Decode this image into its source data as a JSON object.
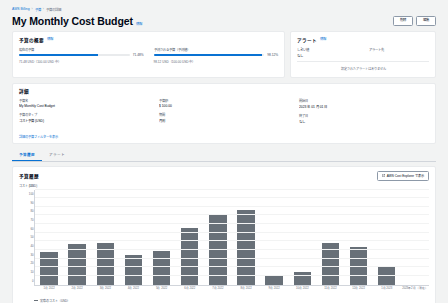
{
  "breadcrumb": {
    "items": [
      "AWS Billing",
      "予算",
      "予算の詳細"
    ]
  },
  "header": {
    "title": "My Monthly Cost Budget",
    "info_label": "情報",
    "edit_label": "編集",
    "delete_label": "削除"
  },
  "budget_panel": {
    "title": "予算の概要",
    "info_label": "情報",
    "metrics": [
      {
        "label": "現在の予算",
        "percent_text": "71.48%",
        "percent": 71.48,
        "sub": "71.48 USD（100.00 USD 中）"
      },
      {
        "label": "予測される予算（予測値）",
        "percent_text": "98.12%",
        "percent": 98.12,
        "sub": "98.12 USD（100.00 USD 中）"
      }
    ]
  },
  "alert_panel": {
    "title": "アラート",
    "info_label": "情報",
    "columns": [
      {
        "label": "しきい値",
        "value": "なし"
      },
      {
        "label": "アラート先",
        "value": ""
      }
    ],
    "empty_text": "設定されたアラートはありません"
  },
  "detail_panel": {
    "title": "詳細",
    "fields": [
      {
        "label": "予算名",
        "value": "My Monthly Cost Budget"
      },
      {
        "label": "予算のタイプ",
        "value": "コスト予算 (USD)"
      },
      {
        "label": "予算額",
        "value": "$ 100.00"
      },
      {
        "label": "期間",
        "value": "月別"
      },
      {
        "label": "開始日",
        "value": "2023 年 01 月 01 日"
      },
      {
        "label": "終了日",
        "value": "なし"
      }
    ],
    "link_label": "詳細の予算フィルターを表示"
  },
  "tabs": [
    {
      "label": "予算履歴",
      "active": true
    },
    {
      "label": "アラート",
      "active": false
    }
  ],
  "chart_panel": {
    "title": "予算履歴",
    "explorer_button": "AWS Cost Explorer で表示",
    "icon": "external-link-icon"
  },
  "chart_data": {
    "type": "bar",
    "title": "予算履歴",
    "ylabel": "コスト (USD)",
    "xlabel": "",
    "ylim": [
      0,
      110
    ],
    "ytick_step": 10,
    "grid": true,
    "legend": "実際のコスト（USD）",
    "series_color": "#687078",
    "categories": [
      "1月 2022",
      "2月 2022",
      "3月 2022",
      "4月 2022",
      "5月 2022",
      "6月 2022",
      "7月 2022",
      "8月 2022",
      "9月 2022",
      "10月 2022",
      "11月 2022",
      "12月 2022",
      "1月 2023",
      "2023年2月（現在）"
    ],
    "values": [
      38,
      47,
      48,
      34,
      39,
      66,
      82,
      86,
      11,
      15,
      48,
      43,
      20,
      0
    ],
    "series": [
      {
        "name": "実際のコスト（USD）",
        "values": [
          38,
          47,
          48,
          34,
          39,
          66,
          82,
          86,
          11,
          15,
          48,
          43,
          20,
          0
        ]
      }
    ]
  }
}
